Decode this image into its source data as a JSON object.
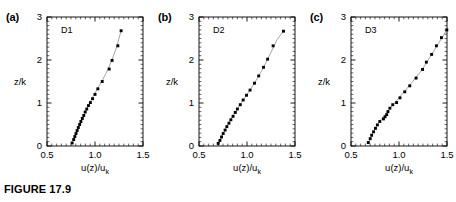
{
  "figure": {
    "caption": "FIGURE 17.9",
    "xlabel": "u(z)/u",
    "xlabel_sub": "k",
    "ylabel": "z/k"
  },
  "panels": [
    {
      "label": "(a)",
      "series_label": "D1",
      "chart_data": {
        "type": "scatter",
        "title": "D1",
        "xlabel": "u(z)/u_k",
        "ylabel": "z/k",
        "xlim": [
          0.5,
          1.5
        ],
        "ylim": [
          0,
          3
        ],
        "xticks": [
          "0.5",
          "1.0",
          "1.5"
        ],
        "xtickvals": [
          0.5,
          1.0,
          1.5
        ],
        "yticks": [
          "0",
          "1",
          "2",
          "3"
        ],
        "ytickvals": [
          0,
          1,
          2,
          3
        ],
        "grid": false,
        "legend": "none",
        "points": [
          {
            "x": 0.762,
            "y": 0.07
          },
          {
            "x": 0.778,
            "y": 0.15
          },
          {
            "x": 0.79,
            "y": 0.22
          },
          {
            "x": 0.802,
            "y": 0.29
          },
          {
            "x": 0.814,
            "y": 0.36
          },
          {
            "x": 0.826,
            "y": 0.43
          },
          {
            "x": 0.84,
            "y": 0.5
          },
          {
            "x": 0.853,
            "y": 0.57
          },
          {
            "x": 0.868,
            "y": 0.64
          },
          {
            "x": 0.883,
            "y": 0.71
          },
          {
            "x": 0.898,
            "y": 0.79
          },
          {
            "x": 0.914,
            "y": 0.86
          },
          {
            "x": 0.932,
            "y": 0.94
          },
          {
            "x": 0.952,
            "y": 1.01
          },
          {
            "x": 0.975,
            "y": 1.1
          },
          {
            "x": 1.0,
            "y": 1.2
          },
          {
            "x": 1.03,
            "y": 1.33
          },
          {
            "x": 1.075,
            "y": 1.5
          },
          {
            "x": 1.148,
            "y": 1.79
          },
          {
            "x": 1.178,
            "y": 1.99
          },
          {
            "x": 1.238,
            "y": 2.33
          },
          {
            "x": 1.272,
            "y": 2.68
          }
        ],
        "fit_curve": [
          {
            "x": 0.76,
            "y": 0.05
          },
          {
            "x": 0.8,
            "y": 0.28
          },
          {
            "x": 0.845,
            "y": 0.52
          },
          {
            "x": 0.89,
            "y": 0.75
          },
          {
            "x": 0.935,
            "y": 0.96
          },
          {
            "x": 0.98,
            "y": 1.15
          },
          {
            "x": 1.03,
            "y": 1.35
          },
          {
            "x": 1.08,
            "y": 1.54
          },
          {
            "x": 1.13,
            "y": 1.76
          },
          {
            "x": 1.18,
            "y": 2.02
          },
          {
            "x": 1.225,
            "y": 2.3
          },
          {
            "x": 1.272,
            "y": 2.68
          }
        ]
      }
    },
    {
      "label": "(b)",
      "series_label": "D2",
      "chart_data": {
        "type": "scatter",
        "title": "D2",
        "xlabel": "u(z)/u_k",
        "ylabel": "z/k",
        "xlim": [
          0.5,
          1.5
        ],
        "ylim": [
          0,
          3
        ],
        "xticks": [
          "0.5",
          "1.0",
          "1.5"
        ],
        "xtickvals": [
          0.5,
          1.0,
          1.5
        ],
        "yticks": [
          "0",
          "1",
          "2",
          "3"
        ],
        "ytickvals": [
          0,
          1,
          2,
          3
        ],
        "grid": false,
        "legend": "none",
        "points": [
          {
            "x": 0.7,
            "y": 0.06
          },
          {
            "x": 0.718,
            "y": 0.13
          },
          {
            "x": 0.735,
            "y": 0.21
          },
          {
            "x": 0.752,
            "y": 0.29
          },
          {
            "x": 0.772,
            "y": 0.37
          },
          {
            "x": 0.79,
            "y": 0.45
          },
          {
            "x": 0.812,
            "y": 0.53
          },
          {
            "x": 0.832,
            "y": 0.61
          },
          {
            "x": 0.855,
            "y": 0.69
          },
          {
            "x": 0.878,
            "y": 0.78
          },
          {
            "x": 0.9,
            "y": 0.86
          },
          {
            "x": 0.93,
            "y": 0.96
          },
          {
            "x": 0.96,
            "y": 1.07
          },
          {
            "x": 0.995,
            "y": 1.18
          },
          {
            "x": 1.032,
            "y": 1.3
          },
          {
            "x": 1.078,
            "y": 1.46
          },
          {
            "x": 1.122,
            "y": 1.63
          },
          {
            "x": 1.172,
            "y": 1.83
          },
          {
            "x": 1.215,
            "y": 2.02
          },
          {
            "x": 1.272,
            "y": 2.33
          },
          {
            "x": 1.38,
            "y": 2.67
          }
        ],
        "fit_curve": [
          {
            "x": 0.7,
            "y": 0.05
          },
          {
            "x": 0.745,
            "y": 0.26
          },
          {
            "x": 0.79,
            "y": 0.46
          },
          {
            "x": 0.84,
            "y": 0.65
          },
          {
            "x": 0.89,
            "y": 0.83
          },
          {
            "x": 0.945,
            "y": 1.02
          },
          {
            "x": 1.0,
            "y": 1.2
          },
          {
            "x": 1.06,
            "y": 1.4
          },
          {
            "x": 1.12,
            "y": 1.62
          },
          {
            "x": 1.18,
            "y": 1.86
          },
          {
            "x": 1.25,
            "y": 2.18
          },
          {
            "x": 1.315,
            "y": 2.48
          },
          {
            "x": 1.38,
            "y": 2.67
          }
        ]
      }
    },
    {
      "label": "(c)",
      "series_label": "D3",
      "chart_data": {
        "type": "scatter",
        "title": "D3",
        "xlabel": "u(z)/u_k",
        "ylabel": "z/k",
        "xlim": [
          0.5,
          1.5
        ],
        "ylim": [
          0,
          3
        ],
        "xticks": [
          "0.5",
          "1.0",
          "1.5"
        ],
        "xtickvals": [
          0.5,
          1.0,
          1.5
        ],
        "yticks": [
          "0",
          "1",
          "2",
          "3"
        ],
        "ytickvals": [
          0,
          1,
          2,
          3
        ],
        "grid": false,
        "legend": "none",
        "points": [
          {
            "x": 0.68,
            "y": 0.08
          },
          {
            "x": 0.7,
            "y": 0.17
          },
          {
            "x": 0.715,
            "y": 0.25
          },
          {
            "x": 0.735,
            "y": 0.33
          },
          {
            "x": 0.755,
            "y": 0.41
          },
          {
            "x": 0.775,
            "y": 0.49
          },
          {
            "x": 0.8,
            "y": 0.57
          },
          {
            "x": 0.838,
            "y": 0.63
          },
          {
            "x": 0.855,
            "y": 0.68
          },
          {
            "x": 0.872,
            "y": 0.73
          },
          {
            "x": 0.885,
            "y": 0.8
          },
          {
            "x": 0.905,
            "y": 0.88
          },
          {
            "x": 0.935,
            "y": 0.96
          },
          {
            "x": 0.975,
            "y": 1.01
          },
          {
            "x": 1.01,
            "y": 1.12
          },
          {
            "x": 1.06,
            "y": 1.26
          },
          {
            "x": 1.112,
            "y": 1.4
          },
          {
            "x": 1.178,
            "y": 1.58
          },
          {
            "x": 1.245,
            "y": 1.78
          },
          {
            "x": 1.285,
            "y": 1.95
          },
          {
            "x": 1.34,
            "y": 2.13
          },
          {
            "x": 1.39,
            "y": 2.33
          },
          {
            "x": 1.442,
            "y": 2.52
          },
          {
            "x": 1.498,
            "y": 2.7
          }
        ],
        "fit_curve": [
          {
            "x": 0.68,
            "y": 0.06
          },
          {
            "x": 0.72,
            "y": 0.27
          },
          {
            "x": 0.765,
            "y": 0.47
          },
          {
            "x": 0.815,
            "y": 0.62
          },
          {
            "x": 0.865,
            "y": 0.75
          },
          {
            "x": 0.915,
            "y": 0.9
          },
          {
            "x": 0.97,
            "y": 1.04
          },
          {
            "x": 1.03,
            "y": 1.2
          },
          {
            "x": 1.095,
            "y": 1.37
          },
          {
            "x": 1.165,
            "y": 1.56
          },
          {
            "x": 1.24,
            "y": 1.77
          },
          {
            "x": 1.32,
            "y": 2.06
          },
          {
            "x": 1.41,
            "y": 2.38
          },
          {
            "x": 1.498,
            "y": 2.7
          }
        ]
      }
    }
  ]
}
